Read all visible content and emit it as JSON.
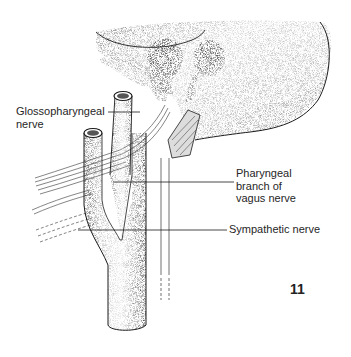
{
  "figure": {
    "number": "11"
  },
  "labels": {
    "glossopharyngeal": [
      "Glossopharyngeal",
      "nerve"
    ],
    "pharyngeal_branch": [
      "Pharyngeal",
      "branch of",
      "vagus nerve"
    ],
    "sympathetic": [
      "Sympathetic nerve"
    ]
  },
  "colors": {
    "ink": "#1a1a1a",
    "stipple": "#555555",
    "background": "#ffffff"
  }
}
